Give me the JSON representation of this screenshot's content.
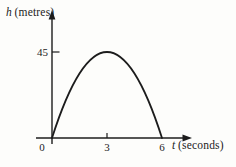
{
  "figure": {
    "y_axis": {
      "variable": "h",
      "unit": "(metres)"
    },
    "x_axis": {
      "variable": "t",
      "unit": "(seconds)"
    }
  },
  "chart_data": {
    "type": "line",
    "title": "",
    "xlabel": "t (seconds)",
    "ylabel": "h (metres)",
    "x": [
      0,
      1,
      2,
      3,
      4,
      5,
      6
    ],
    "y": [
      0,
      25,
      40,
      45,
      40,
      25,
      0
    ],
    "x_ticks": [
      0,
      3,
      6
    ],
    "y_ticks": [
      45
    ],
    "x_tick_marks": [
      3
    ],
    "y_tick_marks": [
      45
    ],
    "xlim": [
      0,
      7.3
    ],
    "ylim": [
      0,
      64
    ],
    "grid": false,
    "legend": null,
    "curve": {
      "shape": "parabola",
      "zeros": [
        0,
        6
      ],
      "peak": {
        "t": 3,
        "h": 45
      }
    }
  },
  "colors": {
    "ink": "#1c1c1c",
    "background": "#fdfdfb"
  }
}
